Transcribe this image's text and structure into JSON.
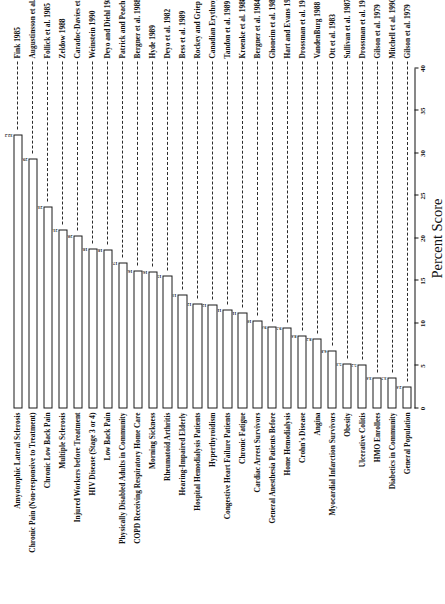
{
  "chart_data": {
    "type": "bar",
    "orientation": "horizontal",
    "title": "",
    "xlabel": "Percent Score",
    "ylabel": "",
    "xlim": [
      0,
      40
    ],
    "xticks": [
      0,
      5,
      10,
      15,
      20,
      25,
      30,
      35,
      40
    ],
    "xtick_labels": [
      "0",
      "5",
      "10",
      "15",
      "20",
      "25",
      "30",
      "35",
      "40"
    ],
    "grid": false,
    "legend": false,
    "categories": [
      "General Population",
      "Diabetics in Community",
      "HMO Enrollees",
      "Ulcerative Colitis",
      "Obesity",
      "Myocardial Infarction Survivors",
      "Angina",
      "Crohn's Disease",
      "Home Hemodialysis",
      "General Anesthesia Patients Before",
      "Cardiac Arrest Survivors",
      "Chronic Fatigue",
      "Congestive Heart Failure Patients",
      "Hyperthyroidism",
      "Hospital Hemodialysis Patients",
      "Hearing-Impaired Elderly",
      "Rheumatoid Arthritis",
      "Morning Sickness",
      "COPD Receiving Respiratory Home Care",
      "Physically Disabled Adults in Community",
      "Low Back Pain",
      "HIV Disease (Stage 3 or 4)",
      "Injured Workers before Treatment",
      "Multiple Sclerosis",
      "Chronic Low Back Pain",
      "Chronic Pain (Non-responsive to Treatment)",
      "Amyotrophic Lateral Sclerosis"
    ],
    "values": [
      2.6,
      3.7,
      3.6,
      5.2,
      5.3,
      6.8,
      8.2,
      8.6,
      9.5,
      9.6,
      10.3,
      11.3,
      11.6,
      12.2,
      12.3,
      13.4,
      15.6,
      16.1,
      16.2,
      17.2,
      18.7,
      18.8,
      20.4,
      21.1,
      23.8,
      29.4,
      32.2
    ],
    "value_labels": [
      "2.6",
      "3.7",
      "3.6",
      "5.2",
      "5.3",
      "6.8",
      "8.2",
      "8.6",
      "9.5",
      "9.6",
      "10.3",
      "11.3",
      "11.6",
      "12.2",
      "12.3",
      "13.4",
      "15.6",
      "16.1",
      "16.2",
      "17.2",
      "18.7",
      "18.8",
      "20.4",
      "21.1",
      "23.8",
      "29.4",
      "32.2"
    ],
    "citations": [
      "Gilson et al. 1979",
      "Mitchell et al. 1990",
      "Gilson et al. 1979",
      "Drossman et al. 1989",
      "Sullivan et al. 1987",
      "Ott et al. 1983",
      "VandenBurg 1988",
      "Drossman et al. 1989",
      "Hart and Evans 1987",
      "Ghoneim et al. 1988",
      "Bergner et al. 1984; 1985",
      "Kroenke et al. 1988",
      "Tandon et al. 1989",
      "Canadian Erythropoietin Study Group 1990",
      "Rockey and Griep 1980",
      "Bess et al. 1989",
      "Deyo et al. 1982",
      "Hyde 1989",
      "Bergner et al. 1988",
      "Patrick and Peach 1989",
      "Deyo and Diehl 1983",
      "Weinstein 1990",
      "Caradoc-Davies et al. 1990",
      "Zeldow 1988",
      "Follick et al. 1985",
      "Augustinsson et al. 1986",
      "Fink 1985"
    ]
  },
  "style": {
    "bar_fill": "#ffffff",
    "bar_stroke": "#1a1a1a",
    "text_color": "#111111",
    "leader_style": "dashed"
  }
}
